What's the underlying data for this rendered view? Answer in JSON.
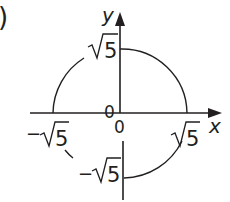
{
  "figure": {
    "part_label": ")",
    "axes": {
      "x_label": "x",
      "y_label": "y"
    },
    "labels": {
      "origin_left": "0",
      "origin_below": "0",
      "y_pos": "5",
      "y_neg_sign": "−",
      "y_neg": "5",
      "x_pos": "5",
      "x_neg_sign": "−",
      "x_neg": "5"
    },
    "curve": "circle x² + y² = 5 (partially drawn)",
    "colors": {
      "ink": "#231f20",
      "background": "#ffffff"
    }
  }
}
